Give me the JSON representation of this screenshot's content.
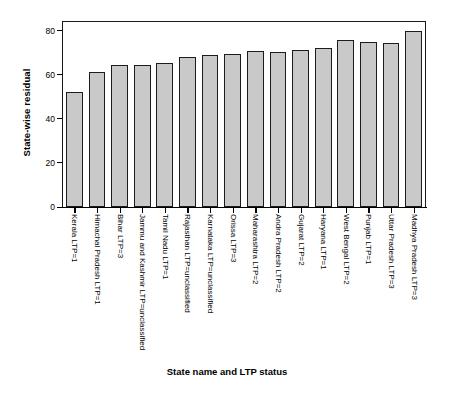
{
  "chart_data": {
    "type": "bar",
    "title": "",
    "xlabel": "State name and LTP status",
    "ylabel": "State-wise residual",
    "ylim": [
      0,
      84
    ],
    "yticks": [
      0,
      20,
      40,
      60,
      80
    ],
    "grid": false,
    "legend": null,
    "bar_fill_color": "#c9c9c9",
    "bar_edge_color": "#1c1c1c",
    "categories": [
      "Kerala LTP=1",
      "Himachal Pradesh LTP=1",
      "Bihar LTP=3",
      "Jammu and Kashmir LTP=unclassified",
      "Tamil Nadu LTP=1",
      "Rajasthan LTP=unclassified",
      "Karnataka LTP=unclassified",
      "Orissa LTP=3",
      "Maharashtra LTP=2",
      "Andra Pradesh LTP=2",
      "Gujarat LTP=2",
      "Haryana LTP=1",
      "West Bengal LTP=2",
      "Punjab LTP=1",
      "Uttar Pradesh LTP=3",
      "Madhya Pradesh LTP=3"
    ],
    "values": [
      52.0,
      61.3,
      64.7,
      64.6,
      65.6,
      68.0,
      69.0,
      69.5,
      71.0,
      70.2,
      71.2,
      72.2,
      75.7,
      74.9,
      74.4,
      79.8
    ]
  }
}
